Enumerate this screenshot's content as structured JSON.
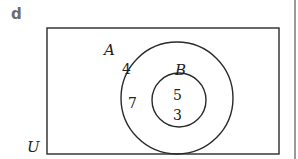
{
  "panel": {
    "label": "d"
  },
  "diagram": {
    "type": "venn",
    "universe_label": "U",
    "sets": [
      {
        "name": "A",
        "label": "A"
      },
      {
        "name": "B",
        "label": "B",
        "subset_of": "A"
      }
    ],
    "regions": {
      "a_only_top": "4",
      "a_only_left": "7",
      "b_top": "5",
      "b_bottom": "3"
    },
    "colors": {
      "stroke": "#2a2a2a",
      "label": "#6b6b6b"
    }
  }
}
